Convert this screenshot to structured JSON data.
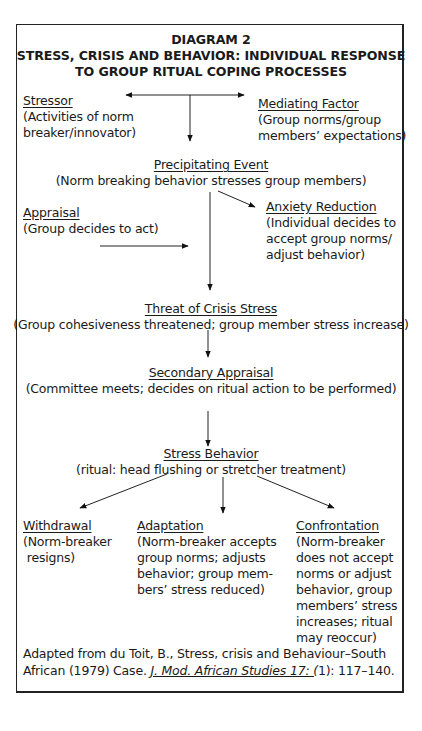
{
  "diagram": {
    "number_label": "DIAGRAM 2",
    "title_line1": "STRESS, CRISIS AND BEHAVIOR: INDIVIDUAL RESPONSE",
    "title_line2": "TO GROUP RITUAL COPING PROCESSES",
    "nodes": {
      "stressor": {
        "heading": "Stressor",
        "lines": [
          "(Activities of norm",
          "breaker/innovator)"
        ]
      },
      "mediating_factor": {
        "heading": "Mediating Factor",
        "lines": [
          "(Group norms/group",
          "members’ expectations)"
        ]
      },
      "precipitating_event": {
        "heading": "Precipitating Event",
        "lines": [
          "(Norm breaking behavior stresses group members)"
        ]
      },
      "appraisal": {
        "heading": "Appraisal",
        "lines": [
          "(Group decides to act)"
        ]
      },
      "anxiety_reduction": {
        "heading": "Anxiety Reduction",
        "lines": [
          "(Individual decides to",
          "accept group norms/",
          "adjust behavior)"
        ]
      },
      "threat_of_crisis_stress": {
        "heading": "Threat of Crisis Stress",
        "lines": [
          "(Group cohesiveness threatened; group member stress increase)"
        ]
      },
      "secondary_appraisal": {
        "heading": "Secondary Appraisal",
        "lines": [
          "(Committee meets; decides on ritual action to be performed)"
        ]
      },
      "stress_behavior": {
        "heading": "Stress Behavior",
        "lines": [
          "(ritual: head flushing or stretcher treatment)"
        ]
      },
      "withdrawal": {
        "heading": "Withdrawal",
        "lines": [
          "(Norm-breaker",
          " resigns)"
        ]
      },
      "adaptation": {
        "heading": "Adaptation",
        "lines": [
          "(Norm-breaker accepts",
          "group norms; adjusts",
          "behavior; group mem-",
          "bers’ stress reduced)"
        ]
      },
      "confrontation": {
        "heading": "Confrontation",
        "lines": [
          "(Norm-breaker",
          "does not accept",
          "norms or adjust",
          "behavior, group",
          "members’ stress",
          "increases; ritual",
          "may reoccur)"
        ]
      }
    },
    "edges": [
      {
        "from": "split",
        "to": "stressor"
      },
      {
        "from": "split",
        "to": "mediating_factor"
      },
      {
        "from": "split",
        "to": "precipitating_event"
      },
      {
        "from": "precipitating_event",
        "to": "anxiety_reduction"
      },
      {
        "from": "precipitating_event",
        "to": "threat_of_crisis_stress"
      },
      {
        "from": "appraisal",
        "to": "precipitating_event-threat line"
      },
      {
        "from": "threat_of_crisis_stress",
        "to": "secondary_appraisal"
      },
      {
        "from": "secondary_appraisal",
        "to": "stress_behavior"
      },
      {
        "from": "stress_behavior",
        "to": "withdrawal"
      },
      {
        "from": "stress_behavior",
        "to": "adaptation"
      },
      {
        "from": "stress_behavior",
        "to": "confrontation"
      }
    ],
    "citation": {
      "line1": "Adapted from du Toit, B., Stress, crisis and Behaviour–South",
      "line2_prefix": "African (1979) Case. ",
      "line2_journal": "J. Mod. African Studies 17: (",
      "line2_suffix": "1): 117–140."
    }
  }
}
